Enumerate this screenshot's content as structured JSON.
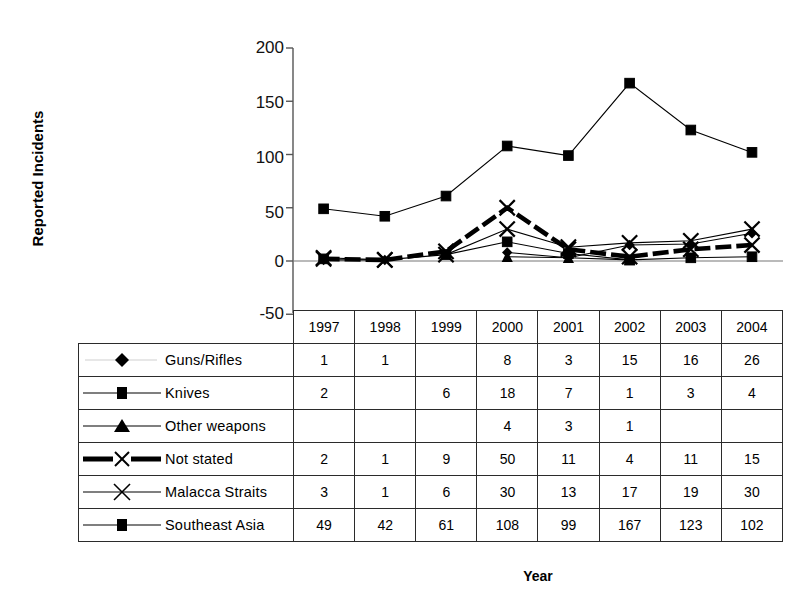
{
  "chart_data": {
    "type": "line",
    "title": "",
    "xlabel": "Year",
    "ylabel": "Reported Incidents",
    "categories": [
      "1997",
      "1998",
      "1999",
      "2000",
      "2001",
      "2002",
      "2003",
      "2004"
    ],
    "ylim": [
      -50,
      200
    ],
    "yticks": [
      200,
      150,
      100,
      50,
      0,
      -50
    ],
    "grid": false,
    "legend_position": "table-left",
    "series": [
      {
        "name": "Guns/Rifles",
        "marker": "diamond",
        "line": "solid-thin",
        "values": [
          1,
          1,
          null,
          8,
          3,
          15,
          16,
          26
        ]
      },
      {
        "name": "Knives",
        "marker": "square",
        "line": "solid-thin",
        "values": [
          2,
          null,
          6,
          18,
          7,
          1,
          3,
          4
        ]
      },
      {
        "name": "Other weapons",
        "marker": "triangle",
        "line": "solid-thin",
        "values": [
          null,
          null,
          null,
          4,
          3,
          1,
          null,
          null
        ]
      },
      {
        "name": "Not stated",
        "marker": "x",
        "line": "dashed-thick",
        "values": [
          2,
          1,
          9,
          50,
          11,
          4,
          11,
          15
        ]
      },
      {
        "name": "Malacca Straits",
        "marker": "x",
        "line": "solid-thin",
        "values": [
          3,
          1,
          6,
          30,
          13,
          17,
          19,
          30
        ]
      },
      {
        "name": "Southeast Asia",
        "marker": "square",
        "line": "solid-thin",
        "values": [
          49,
          42,
          61,
          108,
          99,
          167,
          123,
          102
        ]
      }
    ]
  },
  "axis": {
    "y_title": "Reported Incidents",
    "x_title": "Year",
    "ticks": {
      "t200": "200",
      "t150": "150",
      "t100": "100",
      "t50": "50",
      "t0": "0",
      "tm50": "-50"
    }
  },
  "table": {
    "corner_label": "",
    "year_headers": [
      "1997",
      "1998",
      "1999",
      "2000",
      "2001",
      "2002",
      "2003",
      "2004"
    ],
    "rows": [
      {
        "label": "Guns/Rifles",
        "marker": "diamond-marker-icon",
        "values": [
          "1",
          "1",
          "",
          "8",
          "3",
          "15",
          "16",
          "26"
        ]
      },
      {
        "label": "Knives",
        "marker": "square-marker-icon",
        "values": [
          "2",
          "",
          "6",
          "18",
          "7",
          "1",
          "3",
          "4"
        ]
      },
      {
        "label": "Other weapons",
        "marker": "triangle-marker-icon",
        "values": [
          "",
          "",
          "",
          "4",
          "3",
          "1",
          "",
          ""
        ]
      },
      {
        "label": "Not stated",
        "marker": "x-marker-thick-icon",
        "values": [
          "2",
          "1",
          "9",
          "50",
          "11",
          "4",
          "11",
          "15"
        ]
      },
      {
        "label": "Malacca Straits",
        "marker": "x-marker-icon",
        "values": [
          "3",
          "1",
          "6",
          "30",
          "13",
          "17",
          "19",
          "30"
        ]
      },
      {
        "label": "Southeast Asia",
        "marker": "square-marker-icon",
        "values": [
          "49",
          "42",
          "61",
          "108",
          "99",
          "167",
          "123",
          "102"
        ]
      }
    ]
  },
  "colors": {
    "ink": "#000000",
    "axis": "#555555",
    "background": "#ffffff"
  }
}
